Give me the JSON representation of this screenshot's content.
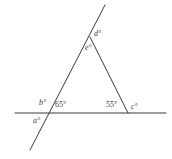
{
  "figure": {
    "background_color": "#ffffff",
    "line_color": "#3a3a3a",
    "text_color": "#3a3a3a",
    "width": 172,
    "height": 159,
    "lines": [
      {
        "name": "horizontal-base-line",
        "x1": 15,
        "y1": 113,
        "x2": 166,
        "y2": 113
      },
      {
        "name": "transversal-line",
        "x1": 105,
        "y1": 5,
        "x2": 30,
        "y2": 150
      },
      {
        "name": "triangle-right-side",
        "x1": 90,
        "y1": 37,
        "x2": 128,
        "y2": 113
      }
    ],
    "vertices": [
      {
        "name": "apex",
        "x": 90,
        "y": 37
      },
      {
        "name": "left-vertex",
        "x": 49,
        "y": 113
      },
      {
        "name": "right-vertex",
        "x": 128,
        "y": 113
      }
    ],
    "labels": [
      {
        "name": "angle-label-d",
        "text": "d°",
        "x": 94,
        "y": 30,
        "style": "var"
      },
      {
        "name": "angle-label-e",
        "text": "e°",
        "x": 85,
        "y": 44,
        "style": "var"
      },
      {
        "name": "angle-label-b",
        "text": "b°",
        "x": 39,
        "y": 99,
        "style": "var"
      },
      {
        "name": "angle-label-65",
        "text": "65°",
        "x": 55,
        "y": 101,
        "style": "num"
      },
      {
        "name": "angle-label-a",
        "text": "a°",
        "x": 33,
        "y": 117,
        "style": "var"
      },
      {
        "name": "angle-label-55",
        "text": "55°",
        "x": 106,
        "y": 101,
        "style": "num"
      },
      {
        "name": "angle-label-c",
        "text": "c°",
        "x": 131,
        "y": 103,
        "style": "var"
      }
    ]
  }
}
